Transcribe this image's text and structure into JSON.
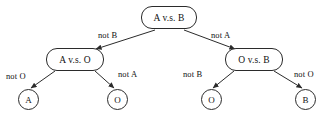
{
  "diagram": {
    "type": "decision-tree",
    "stroke_color": "#2b2b2b",
    "text_color": "#111111",
    "background_color": "#ffffff",
    "nodes": [
      {
        "id": "root",
        "label": "A v.s. B",
        "shape": "rounded-rect",
        "x": 141,
        "y": 6,
        "w": 56,
        "h": 23
      },
      {
        "id": "left_mid",
        "label": "A v.s. O",
        "shape": "rounded-rect",
        "x": 46,
        "y": 48,
        "w": 58,
        "h": 23
      },
      {
        "id": "right_mid",
        "label": "O v.s. B",
        "shape": "rounded-rect",
        "x": 225,
        "y": 48,
        "w": 58,
        "h": 23
      },
      {
        "id": "leaf_a",
        "label": "A",
        "shape": "circle",
        "x": 18,
        "y": 89,
        "w": 21,
        "h": 21
      },
      {
        "id": "leaf_o1",
        "label": "O",
        "shape": "circle",
        "x": 107,
        "y": 89,
        "w": 21,
        "h": 21
      },
      {
        "id": "leaf_o2",
        "label": "O",
        "shape": "circle",
        "x": 201,
        "y": 89,
        "w": 21,
        "h": 21
      },
      {
        "id": "leaf_b",
        "label": "B",
        "shape": "circle",
        "x": 295,
        "y": 89,
        "w": 21,
        "h": 21
      }
    ],
    "edges": [
      {
        "id": "root-left",
        "from": "root",
        "to": "left_mid",
        "label": "not B",
        "label_x": 98,
        "label_y": 30,
        "x1": 155,
        "y1": 30,
        "x2": 96,
        "y2": 49
      },
      {
        "id": "root-right",
        "from": "root",
        "to": "right_mid",
        "label": "not A",
        "label_x": 211,
        "label_y": 30,
        "x1": 184,
        "y1": 30,
        "x2": 235,
        "y2": 49
      },
      {
        "id": "leftmid-leafa",
        "from": "left_mid",
        "to": "leaf_a",
        "label": "not O",
        "label_x": 6,
        "label_y": 71,
        "x1": 55,
        "y1": 71,
        "x2": 31,
        "y2": 88
      },
      {
        "id": "leftmid-leafo",
        "from": "left_mid",
        "to": "leaf_o1",
        "label": "not A",
        "label_x": 118,
        "label_y": 69,
        "x1": 95,
        "y1": 71,
        "x2": 114,
        "y2": 88
      },
      {
        "id": "rightmid-leafo",
        "from": "right_mid",
        "to": "leaf_o2",
        "label": "not B",
        "label_x": 183,
        "label_y": 69,
        "x1": 234,
        "y1": 71,
        "x2": 213,
        "y2": 88
      },
      {
        "id": "rightmid-leafb",
        "from": "right_mid",
        "to": "leaf_b",
        "label": "not O",
        "label_x": 294,
        "label_y": 69,
        "x1": 274,
        "y1": 71,
        "x2": 302,
        "y2": 88
      }
    ]
  }
}
